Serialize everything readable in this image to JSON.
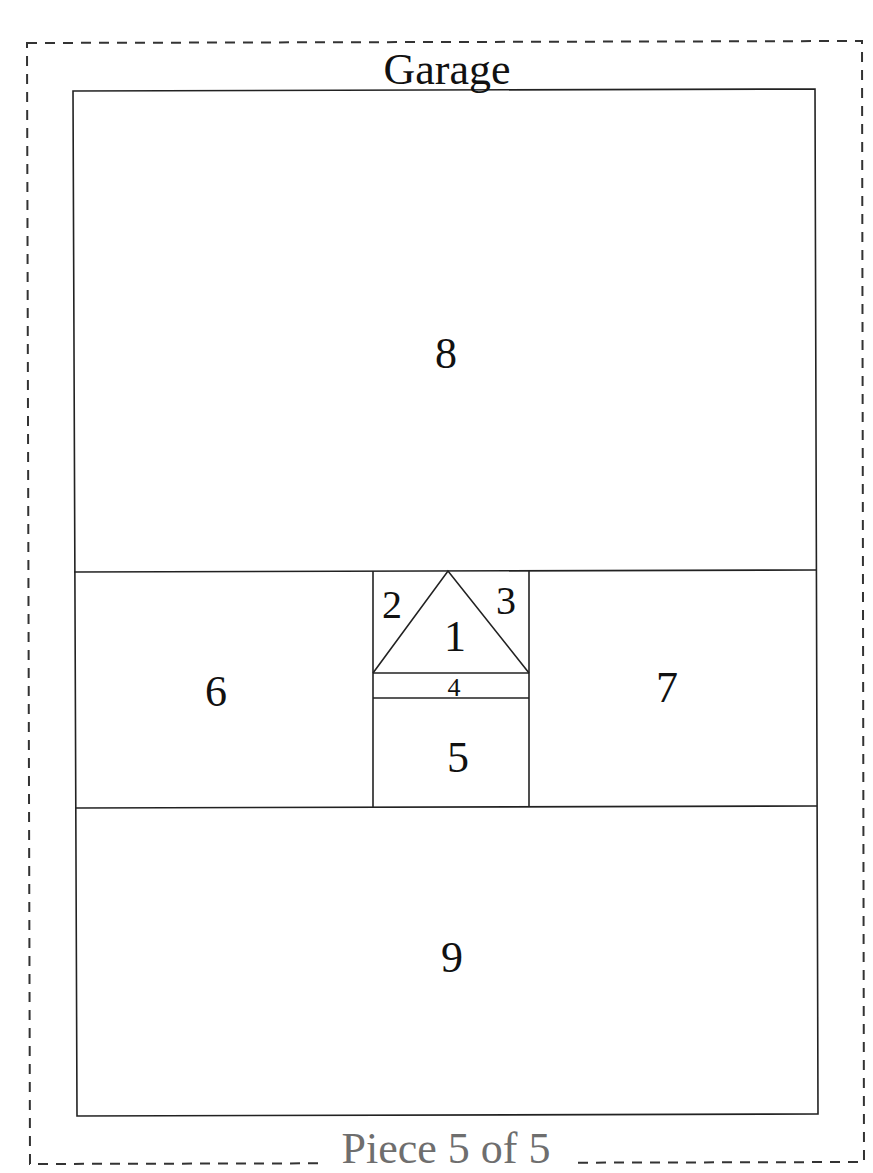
{
  "title": "Garage",
  "footer": "Piece 5 of 5",
  "colors": {
    "line": "#222222",
    "dashed_border": "#333333",
    "label": "#111111",
    "footer_text": "#6e6e6e",
    "background": "#ffffff"
  },
  "sections": [
    {
      "id": "1",
      "label": "1",
      "shape": "triangle"
    },
    {
      "id": "2",
      "label": "2",
      "shape": "corner-triangle-left"
    },
    {
      "id": "3",
      "label": "3",
      "shape": "corner-triangle-right"
    },
    {
      "id": "4",
      "label": "4",
      "shape": "strip"
    },
    {
      "id": "5",
      "label": "5",
      "shape": "rectangle"
    },
    {
      "id": "6",
      "label": "6",
      "shape": "rectangle"
    },
    {
      "id": "7",
      "label": "7",
      "shape": "rectangle"
    },
    {
      "id": "8",
      "label": "8",
      "shape": "rectangle"
    },
    {
      "id": "9",
      "label": "9",
      "shape": "rectangle"
    }
  ]
}
